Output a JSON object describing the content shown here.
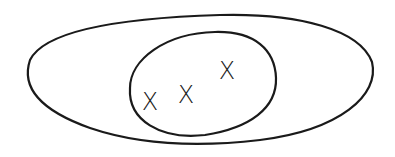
{
  "diagram": {
    "type": "nested-sets",
    "stroke_color": "#1a1a1a",
    "background": "#ffffff",
    "outer_set": {
      "label": ""
    },
    "inner_set": {
      "label": ""
    },
    "elements": [
      {
        "label": "X",
        "x": 150,
        "y": 101
      },
      {
        "label": "X",
        "x": 186,
        "y": 94
      },
      {
        "label": "X",
        "x": 227,
        "y": 70
      }
    ]
  }
}
